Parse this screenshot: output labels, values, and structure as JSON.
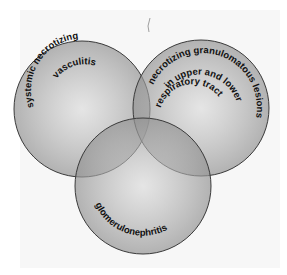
{
  "diagram": {
    "type": "venn",
    "sets": [
      {
        "id": "left",
        "label": "systemic necrotizing",
        "label2": "vasculitis"
      },
      {
        "id": "right",
        "label": "necrotizing granulomatous lesions",
        "label2": "in upper and lower",
        "label3": "respiratory tract"
      },
      {
        "id": "bottom",
        "label": "glomerulonephritis"
      }
    ],
    "colors": {
      "background": "#f7f7f7",
      "circle_fill": "#9a9a9a",
      "circle_stroke": "#3a3a3a",
      "text": "#111111"
    }
  }
}
